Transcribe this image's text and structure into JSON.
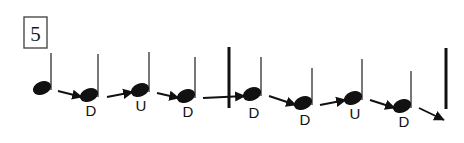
{
  "figure": {
    "type": "strum-pattern-notation",
    "measure_number": "5",
    "background_color": "#ffffff",
    "ink_color": "#111111"
  },
  "notes": [
    {
      "id": "note-1",
      "label": "",
      "head_x": 42,
      "head_y": 88,
      "stem_top_y": 53,
      "stem_x": 51,
      "label_x": 0,
      "label_y": 0
    },
    {
      "id": "note-2",
      "label": "D",
      "head_x": 89,
      "head_y": 95,
      "stem_top_y": 54,
      "stem_x": 98,
      "label_x": 91,
      "label_y": 116
    },
    {
      "id": "note-3",
      "label": "U",
      "head_x": 140,
      "head_y": 90,
      "stem_top_y": 52,
      "stem_x": 149,
      "label_x": 141,
      "label_y": 111
    },
    {
      "id": "note-4",
      "label": "D",
      "head_x": 186,
      "head_y": 96,
      "stem_top_y": 57,
      "stem_x": 195,
      "label_x": 188,
      "label_y": 117
    },
    {
      "id": "note-5",
      "label": "D",
      "head_x": 252,
      "head_y": 94,
      "stem_top_y": 57,
      "stem_x": 261,
      "label_x": 254,
      "label_y": 118
    },
    {
      "id": "note-6",
      "label": "D",
      "head_x": 303,
      "head_y": 103,
      "stem_top_y": 68,
      "stem_x": 312,
      "label_x": 305,
      "label_y": 125
    },
    {
      "id": "note-7",
      "label": "U",
      "head_x": 353,
      "head_y": 98,
      "stem_top_y": 59,
      "stem_x": 362,
      "label_x": 355,
      "label_y": 119
    },
    {
      "id": "note-8",
      "label": "D",
      "head_x": 402,
      "head_y": 106,
      "stem_top_y": 71,
      "stem_x": 411,
      "label_x": 404,
      "label_y": 127
    }
  ],
  "arrows": [
    {
      "id": "arrow-1",
      "x1": 58,
      "y1": 91,
      "x2": 82,
      "y2": 97
    },
    {
      "id": "arrow-2",
      "x1": 107,
      "y1": 97,
      "x2": 133,
      "y2": 92
    },
    {
      "id": "arrow-3",
      "x1": 157,
      "y1": 93,
      "x2": 179,
      "y2": 98
    },
    {
      "id": "arrow-4",
      "x1": 203,
      "y1": 98,
      "x2": 245,
      "y2": 96
    },
    {
      "id": "arrow-5",
      "x1": 269,
      "y1": 96,
      "x2": 296,
      "y2": 105
    },
    {
      "id": "arrow-6",
      "x1": 320,
      "y1": 105,
      "x2": 346,
      "y2": 100
    },
    {
      "id": "arrow-7",
      "x1": 370,
      "y1": 100,
      "x2": 395,
      "y2": 108
    },
    {
      "id": "arrow-8",
      "x1": 419,
      "y1": 108,
      "x2": 444,
      "y2": 120
    }
  ],
  "barlines": [
    {
      "id": "barline-middle",
      "x": 229,
      "y_top": 47,
      "y_bottom": 108,
      "width": 3
    },
    {
      "id": "barline-end",
      "x": 446,
      "y_top": 48,
      "y_bottom": 109,
      "width": 3
    }
  ],
  "measure_box": {
    "x": 24,
    "y": 17,
    "width": 23,
    "height": 31,
    "label": "5"
  }
}
